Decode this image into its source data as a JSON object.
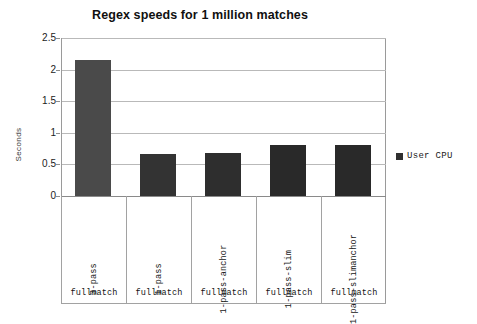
{
  "chart_data": {
    "type": "bar",
    "title": "Regex speeds for 1 million matches",
    "xlabel": "",
    "ylabel": "Seconds",
    "ylim": [
      0,
      2.5
    ],
    "yticks": [
      "0",
      "0.5",
      "1",
      "1.5",
      "2",
      "2.5"
    ],
    "ytick_values": [
      0,
      0.5,
      1,
      1.5,
      2,
      2.5
    ],
    "grid": true,
    "legend_position": "right",
    "categories": [
      "1-pass-slimanchor",
      "1-pass-slim",
      "1-pass-anchor",
      "1-pass",
      "3-pass"
    ],
    "category_labels_top": [
      "3-pass",
      "1-pass",
      "1-pass-anchor",
      "1-pass-slim",
      "1-pass-slimanchor"
    ],
    "category_labels_bottom": [
      "fullmatch",
      "fullmatch",
      "fullmatch",
      "fullmatch",
      "fullmatch"
    ],
    "series": [
      {
        "name": "User CPU",
        "color": "#353535",
        "values": [
          2.15,
          0.67,
          0.68,
          0.81,
          0.81
        ]
      }
    ],
    "bar_colors": [
      "#4a4a4a",
      "#333333",
      "#2e2e2e",
      "#292929",
      "#292929"
    ]
  },
  "legend": {
    "entries": [
      {
        "label": "User CPU",
        "swatch_color": "#303030"
      }
    ]
  },
  "colors": {
    "background": "#ffffff",
    "gridline": "#b9b9b9",
    "axis": "#9a9a9a",
    "text": "#111111"
  }
}
